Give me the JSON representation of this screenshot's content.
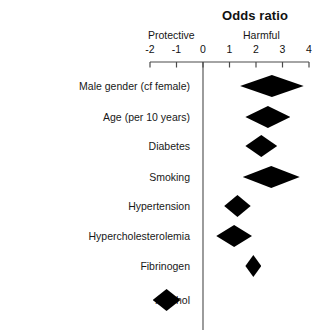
{
  "chart_data": {
    "type": "bar",
    "subtype": "forest-plot",
    "title": "Odds ratio",
    "xlabel": "",
    "ylabel": "",
    "xlim": [
      -2,
      4
    ],
    "xticks": [
      -2,
      -1,
      0,
      1,
      2,
      3,
      4
    ],
    "xtick_labels": [
      "-2",
      "-1",
      "0",
      "1",
      "2",
      "3",
      "4"
    ],
    "grid": false,
    "reference_line": 0,
    "annotations": [
      {
        "text": "Protective",
        "side": "left"
      },
      {
        "text": "Harmful",
        "side": "right"
      }
    ],
    "categories": [
      "Male gender (cf female)",
      "Age (per 10 years)",
      "Diabetes",
      "Smoking",
      "Hypertension",
      "Hypercholesterolemia",
      "Fibrinogen",
      "Alcohol"
    ],
    "values": [
      2.6,
      2.45,
      2.2,
      2.6,
      1.3,
      1.15,
      1.9,
      -1.4
    ],
    "ci_low": [
      1.4,
      1.6,
      1.6,
      1.5,
      0.8,
      0.5,
      1.6,
      -1.9
    ],
    "ci_high": [
      3.8,
      3.3,
      2.8,
      3.65,
      1.8,
      1.85,
      2.2,
      -0.85
    ],
    "marker": "diamond",
    "marker_color": "#000000",
    "rows": [
      {
        "label": "Male gender (cf female)",
        "estimate": 2.6,
        "low": 1.4,
        "high": 3.8
      },
      {
        "label": "Age (per 10 years)",
        "estimate": 2.45,
        "low": 1.6,
        "high": 3.3
      },
      {
        "label": "Diabetes",
        "estimate": 2.2,
        "low": 1.6,
        "high": 2.8
      },
      {
        "label": "Smoking",
        "estimate": 2.6,
        "low": 1.5,
        "high": 3.65
      },
      {
        "label": "Hypertension",
        "estimate": 1.3,
        "low": 0.8,
        "high": 1.8
      },
      {
        "label": "Hypercholesterolemia",
        "estimate": 1.15,
        "low": 0.5,
        "high": 1.85
      },
      {
        "label": "Fibrinogen",
        "estimate": 1.9,
        "low": 1.6,
        "high": 2.2
      },
      {
        "label": "Alcohol",
        "estimate": -1.4,
        "low": -1.9,
        "high": -0.85
      }
    ]
  },
  "chart": {
    "title": "Odds ratio",
    "protective_label": "Protective",
    "harmful_label": "Harmful",
    "tick_labels": [
      "-2",
      "-1",
      "0",
      "1",
      "2",
      "3",
      "4"
    ],
    "row_labels": [
      "Male gender (cf female)",
      "Age (per 10 years)",
      "Diabetes",
      "Smoking",
      "Hypertension",
      "Hypercholesterolemia",
      "Fibrinogen",
      "Alcohol"
    ]
  },
  "colors": {
    "marker": "#000000",
    "axis": "#4a4a4a",
    "text": "#111111",
    "background": "#ffffff"
  }
}
